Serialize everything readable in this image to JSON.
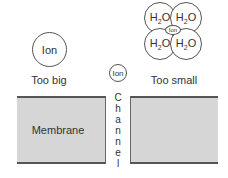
{
  "diagram": {
    "too_big": {
      "ion_label": "Ion",
      "caption": "Too big"
    },
    "channel": {
      "ion_label": "Ion",
      "letters": [
        "C",
        "h",
        "a",
        "n",
        "n",
        "e",
        "l"
      ]
    },
    "too_small": {
      "water_prefix": "H",
      "water_subscript": "2",
      "water_suffix": "O",
      "ion_label": "Ion",
      "caption": "Too small"
    },
    "membrane": {
      "label": "Membrane"
    },
    "colors": {
      "membrane_fill": "#d6d6d6",
      "membrane_edge": "#555555",
      "outline": "#555555",
      "text": "#333333"
    }
  }
}
